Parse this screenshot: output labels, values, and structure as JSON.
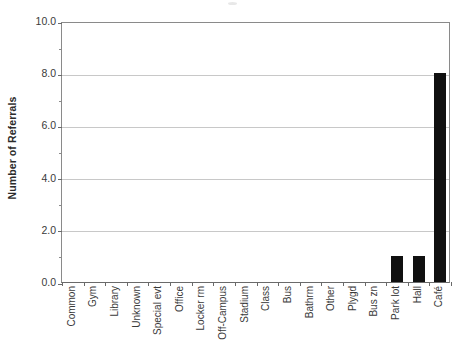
{
  "chart_data": {
    "type": "bar",
    "title": "",
    "subtitle": "",
    "xlabel": "",
    "ylabel": "Number of Referrals",
    "ylim": [
      0,
      10
    ],
    "ytick_step": 2,
    "yminor_step": 1,
    "grid": "horizontal-major-only",
    "legend": "none",
    "bar_color": "#101010",
    "categories": [
      "Common",
      "Gym",
      "Library",
      "Unknown",
      "Special evt",
      "Office",
      "Locker rm",
      "Off-Campus",
      "Stadium",
      "Class",
      "Bus",
      "Bathrm",
      "Other",
      "Plygd",
      "Bus zn",
      "Park lot",
      "Hall",
      "Café"
    ],
    "values": [
      0,
      0,
      0,
      0,
      0,
      0,
      0,
      0,
      0,
      0,
      0,
      0,
      0,
      0,
      0,
      1,
      1,
      8
    ],
    "ytick_labels": [
      "0.0",
      "2.0",
      "4.0",
      "6.0",
      "8.0",
      "10.0"
    ],
    "ytick_values": [
      0,
      2,
      4,
      6,
      8,
      10
    ],
    "yminor_values": [
      1,
      3,
      5,
      7,
      9
    ]
  },
  "axes": {
    "y_title": "Number of Referrals"
  }
}
